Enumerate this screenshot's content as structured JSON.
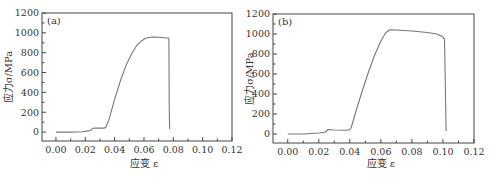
{
  "chart_data": [
    {
      "type": "line",
      "panel_label": "(a)",
      "xlabel": "应变 ε",
      "ylabel": "应力σ/MPa",
      "xlim": [
        -0.0095,
        0.12
      ],
      "ylim": [
        -90,
        1200
      ],
      "xticks": [
        0.0,
        0.02,
        0.04,
        0.06,
        0.08,
        0.1,
        0.12
      ],
      "xtick_labels": [
        "0.00",
        "0.02",
        "0.04",
        "0.06",
        "0.08",
        "0.10",
        "0.12"
      ],
      "yticks": [
        0,
        200,
        400,
        600,
        800,
        1000,
        1200
      ],
      "ytick_labels": [
        "0",
        "200",
        "400",
        "600",
        "800",
        "1000",
        "1200"
      ],
      "grid": false,
      "series": [
        {
          "name": "stress-strain (a)",
          "x": [
            0.0,
            0.01,
            0.018,
            0.022,
            0.024,
            0.025,
            0.027,
            0.033,
            0.034,
            0.036,
            0.04,
            0.044,
            0.048,
            0.052,
            0.055,
            0.058,
            0.061,
            0.064,
            0.067,
            0.07,
            0.074,
            0.077,
            0.0772,
            0.0775
          ],
          "y": [
            0,
            0,
            3,
            12,
            22,
            38,
            40,
            40,
            48,
            120,
            330,
            520,
            680,
            800,
            870,
            915,
            945,
            955,
            958,
            955,
            950,
            945,
            300,
            30
          ]
        }
      ]
    },
    {
      "type": "line",
      "panel_label": "(b)",
      "xlabel": "应变 ε",
      "ylabel": "应力σ/MPa",
      "xlim": [
        -0.0095,
        0.12
      ],
      "ylim": [
        -90,
        1200
      ],
      "xticks": [
        0.0,
        0.02,
        0.04,
        0.06,
        0.08,
        0.1,
        0.12
      ],
      "xtick_labels": [
        "0.00",
        "0.02",
        "0.04",
        "0.06",
        "0.08",
        "0.10",
        "0.12"
      ],
      "yticks": [
        0,
        200,
        400,
        600,
        800,
        1000,
        1200
      ],
      "ytick_labels": [
        "0",
        "200",
        "400",
        "600",
        "800",
        "1000",
        "1200"
      ],
      "grid": false,
      "series": [
        {
          "name": "stress-strain (b)",
          "x": [
            0.0,
            0.01,
            0.02,
            0.024,
            0.025,
            0.026,
            0.03,
            0.038,
            0.04,
            0.041,
            0.044,
            0.048,
            0.052,
            0.056,
            0.06,
            0.063,
            0.065,
            0.066,
            0.07,
            0.08,
            0.09,
            0.096,
            0.099,
            0.101,
            0.1015,
            0.102
          ],
          "y": [
            0,
            0,
            10,
            18,
            30,
            45,
            40,
            38,
            42,
            70,
            230,
            430,
            620,
            790,
            930,
            1010,
            1035,
            1042,
            1040,
            1030,
            1015,
            1000,
            980,
            950,
            500,
            30
          ]
        }
      ]
    }
  ]
}
